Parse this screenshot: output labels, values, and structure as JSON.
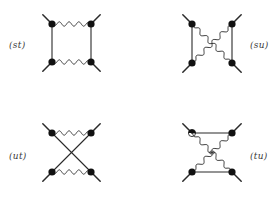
{
  "figure": {
    "colors": {
      "line": "#2a2a2a",
      "vertex": "#111111",
      "label": "#3a3a3a",
      "background": "#ffffff"
    },
    "panels": [
      {
        "id": "st",
        "label": "(st)",
        "label_pos": {
          "x": 9,
          "y": 40
        },
        "vertices": {
          "tl": [
            52,
            24
          ],
          "tr": [
            91,
            24
          ],
          "bl": [
            52,
            62
          ],
          "br": [
            91,
            62
          ]
        },
        "topology": "box",
        "fermion_lines": "vertical",
        "boson_lines": "horizontal"
      },
      {
        "id": "su",
        "label": "(su)",
        "label_pos": {
          "x": 250,
          "y": 40
        },
        "vertices": {
          "tl": [
            192,
            24
          ],
          "tr": [
            232,
            24
          ],
          "bl": [
            192,
            63
          ],
          "br": [
            232,
            63
          ]
        },
        "topology": "crossed-boson",
        "fermion_lines": "vertical",
        "boson_lines": "crossed"
      },
      {
        "id": "ut",
        "label": "(ut)",
        "label_pos": {
          "x": 9,
          "y": 151
        },
        "vertices": {
          "tl": [
            52,
            133
          ],
          "tr": [
            91,
            133
          ],
          "bl": [
            52,
            172
          ],
          "br": [
            91,
            172
          ]
        },
        "topology": "crossed-fermion",
        "fermion_lines": "crossed",
        "boson_lines": "horizontal"
      },
      {
        "id": "tu",
        "label": "(tu)",
        "label_pos": {
          "x": 250,
          "y": 151
        },
        "vertices": {
          "tl": [
            192,
            133
          ],
          "tr": [
            232,
            133
          ],
          "bl": [
            192,
            172
          ],
          "br": [
            232,
            172
          ]
        },
        "topology": "crossed-boson-horizontal-fermion",
        "fermion_lines": "horizontal",
        "boson_lines": "crossed"
      }
    ],
    "leg_length": 13,
    "vertex_radius": 3.6
  }
}
